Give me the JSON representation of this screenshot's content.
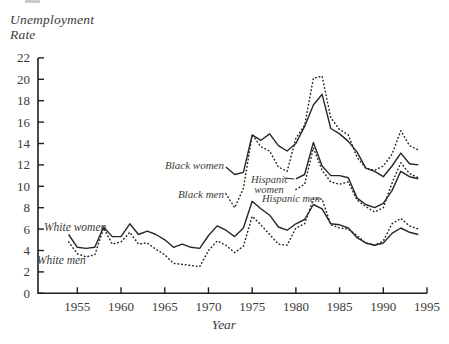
{
  "figure": {
    "title_lines": [
      "Unemployment",
      "Rate"
    ],
    "x_axis_label": "Year",
    "background": "#fffffe",
    "ink_color": "#262626",
    "text_color": "#3b3b3b"
  },
  "chart_data": {
    "type": "line",
    "xlabel": "Year",
    "ylabel": "Unemployment Rate",
    "xlim": [
      1950.5,
      1995
    ],
    "ylim": [
      0,
      22
    ],
    "x_ticks": [
      1955,
      1960,
      1965,
      1970,
      1975,
      1980,
      1985,
      1990,
      1995
    ],
    "y_ticks": [
      0,
      2,
      4,
      6,
      8,
      10,
      12,
      14,
      16,
      18,
      20,
      22
    ],
    "grid": false,
    "legend": "inline-annotations",
    "series": [
      {
        "name": "White women",
        "line_style": "solid",
        "start_year": 1954,
        "values": [
          5.5,
          4.3,
          4.2,
          4.3,
          6.2,
          5.3,
          5.3,
          6.5,
          5.5,
          5.8,
          5.5,
          5.0,
          4.3,
          4.6,
          4.3,
          4.2,
          5.4,
          6.3,
          5.9,
          5.3,
          6.1,
          8.6,
          7.9,
          7.3,
          6.2,
          5.9,
          6.5,
          6.9,
          8.3,
          7.9,
          6.5,
          6.4,
          6.1,
          5.2,
          4.7,
          4.5,
          4.7,
          5.6,
          6.1,
          5.7,
          5.5
        ]
      },
      {
        "name": "White men",
        "line_style": "dotted",
        "start_year": 1954,
        "values": [
          4.8,
          3.7,
          3.4,
          3.6,
          6.1,
          4.6,
          4.8,
          5.7,
          4.6,
          4.7,
          4.1,
          3.6,
          2.8,
          2.7,
          2.6,
          2.5,
          4.0,
          4.9,
          4.5,
          3.8,
          4.4,
          7.2,
          6.4,
          5.5,
          4.6,
          4.5,
          6.1,
          6.5,
          8.8,
          8.8,
          6.4,
          6.1,
          6.0,
          5.4,
          4.7,
          4.5,
          4.9,
          6.5,
          7.0,
          6.3,
          6.0
        ]
      },
      {
        "name": "Black women",
        "line_style": "solid",
        "start_year": 1972,
        "values": [
          11.8,
          11.1,
          11.3,
          14.8,
          14.3,
          14.9,
          13.8,
          13.3,
          14.0,
          15.6,
          17.6,
          18.6,
          15.4,
          14.9,
          14.2,
          13.2,
          11.7,
          11.4,
          10.9,
          11.9,
          13.1,
          12.1,
          12.0
        ]
      },
      {
        "name": "Black men",
        "line_style": "dotted",
        "start_year": 1972,
        "values": [
          9.3,
          8.0,
          9.8,
          14.8,
          13.7,
          13.3,
          11.8,
          11.4,
          14.5,
          15.7,
          20.1,
          20.3,
          16.4,
          15.3,
          14.8,
          12.7,
          11.7,
          11.5,
          11.9,
          13.0,
          15.2,
          13.8,
          13.4
        ]
      },
      {
        "name": "Hispanic women",
        "line_style": "solid",
        "start_year": 1980,
        "values": [
          10.7,
          11.1,
          14.1,
          11.9,
          11.0,
          11.0,
          10.8,
          8.9,
          8.3,
          8.0,
          8.4,
          9.6,
          11.4,
          10.9,
          10.7
        ]
      },
      {
        "name": "Hispanic men",
        "line_style": "dotted",
        "start_year": 1980,
        "values": [
          9.7,
          10.2,
          13.6,
          11.5,
          10.4,
          10.2,
          10.4,
          8.7,
          8.1,
          7.6,
          8.0,
          10.3,
          12.2,
          11.2,
          10.8
        ]
      }
    ],
    "annotations": [
      {
        "text": "White women",
        "x": 44,
        "y": 231,
        "anchor": "start",
        "size": 11.5
      },
      {
        "text": "White men",
        "x": 37,
        "y": 264,
        "anchor": "start",
        "size": 11.5
      },
      {
        "text": "Black women",
        "x": 224,
        "y": 169,
        "anchor": "end",
        "size": 11
      },
      {
        "text": "Black men",
        "x": 224,
        "y": 198,
        "anchor": "end",
        "size": 11
      },
      {
        "text": "Hispanic",
        "x": 270,
        "y": 183,
        "anchor": "middle",
        "size": 10.5
      },
      {
        "text": "women",
        "x": 269,
        "y": 193,
        "anchor": "middle",
        "size": 10.5
      },
      {
        "text": "Hispanic men",
        "x": 262,
        "y": 202,
        "anchor": "start",
        "size": 10.5
      }
    ],
    "leader_lines": [
      {
        "x1": 284,
        "y1": 178,
        "x2": 294,
        "y2": 179
      }
    ]
  }
}
